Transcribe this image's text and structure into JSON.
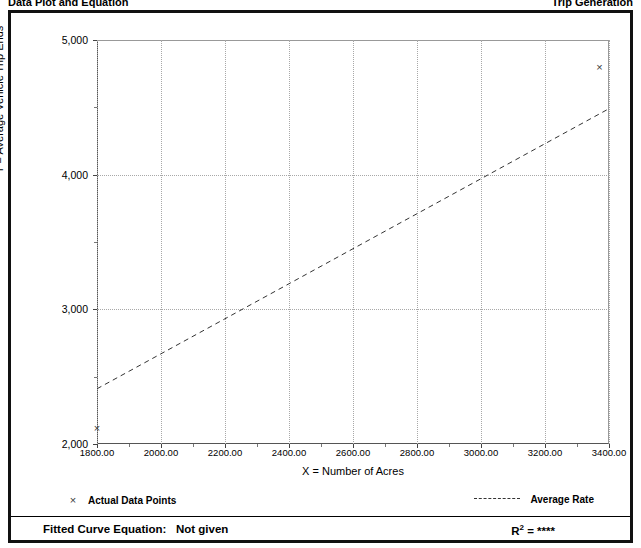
{
  "header": {
    "left_caption": "Data Plot and Equation",
    "right_caption": "Trip Generation"
  },
  "axis_titles": {
    "x": "X = Number of Acres",
    "y": "T = Average Vehicle Trip Ends"
  },
  "legend": {
    "points_marker": "×",
    "points_label": "Actual Data Points",
    "rate_label": "Average Rate"
  },
  "footer": {
    "equation_label": "Fitted Curve Equation:",
    "equation_value": "Not given",
    "r_squared_base": "R",
    "r_squared_exp": "2",
    "r_squared_eq": "=",
    "r_squared_value": "****"
  },
  "chart_data": {
    "type": "scatter",
    "title": "Data Plot and Equation",
    "xlabel": "X = Number of Acres",
    "ylabel": "T = Average Vehicle Trip Ends",
    "xlim": [
      1800,
      3400
    ],
    "ylim": [
      2000,
      5000
    ],
    "xticks": [
      1800,
      2000,
      2200,
      2400,
      2600,
      2800,
      3000,
      3200,
      3400
    ],
    "xtick_labels": [
      "1800.00",
      "2000.00",
      "2200.00",
      "2400.00",
      "2600.00",
      "2800.00",
      "3000.00",
      "3200.00",
      "3400.00"
    ],
    "xticks_minor": [
      1900,
      2100,
      2300,
      2500,
      2700,
      2900,
      3100,
      3300
    ],
    "yticks": [
      2000,
      3000,
      4000,
      5000
    ],
    "ytick_labels": [
      "2,000",
      "3,000",
      "4,000",
      "5,000"
    ],
    "yticks_minor": [
      2500,
      3500,
      4500
    ],
    "grid": true,
    "legend_position": "below-plot",
    "series": [
      {
        "name": "Actual Data Points",
        "type": "scatter",
        "marker": "x",
        "color": "#3a3a3a",
        "points": [
          {
            "x": 1800,
            "y": 2120
          },
          {
            "x": 3370,
            "y": 4800
          }
        ]
      },
      {
        "name": "Average Rate",
        "type": "line",
        "style": "dashed",
        "color": "#333333",
        "points": [
          {
            "x": 1800,
            "y": 2410
          },
          {
            "x": 3400,
            "y": 4490
          }
        ]
      }
    ]
  }
}
